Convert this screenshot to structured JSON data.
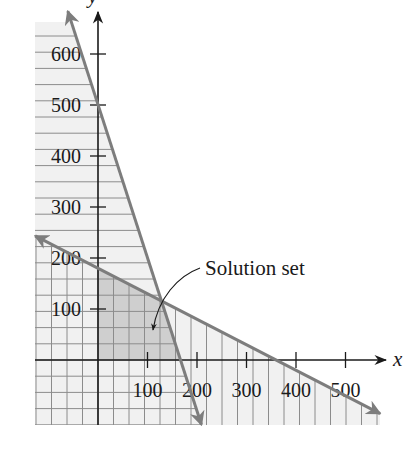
{
  "chart_data": {
    "type": "line",
    "title": "",
    "xlabel": "x",
    "ylabel": "y",
    "xlim": [
      -127,
      570
    ],
    "ylim": [
      -127,
      660
    ],
    "x_ticks": [
      100,
      200,
      300,
      400,
      500
    ],
    "y_ticks": [
      100,
      200,
      300,
      400,
      500,
      600
    ],
    "x_tick_labels": [
      "100",
      "200",
      "300",
      "400",
      "500"
    ],
    "y_tick_labels": [
      "100",
      "200",
      "300",
      "400",
      "500",
      "600"
    ],
    "grid": true,
    "series": [
      {
        "name": "3x + y = 500",
        "x_intercept": 166.7,
        "y_intercept": 500,
        "points": [
          [
            -61,
            684
          ],
          [
            209,
            -127
          ]
        ],
        "shaded_side": "below-left",
        "hatch": "horizontal"
      },
      {
        "name": "x + 2y = 360",
        "x_intercept": 360,
        "y_intercept": 180,
        "points": [
          [
            -127,
            243.5
          ],
          [
            570,
            -105
          ]
        ],
        "shaded_side": "below-left",
        "hatch": "vertical"
      }
    ],
    "intersection": [
      128,
      116
    ],
    "solution_set_vertices": [
      [
        0,
        0
      ],
      [
        0,
        180
      ],
      [
        128,
        116
      ],
      [
        166.7,
        0
      ]
    ],
    "annotations": [
      {
        "text": "Solution set",
        "points_to": [
          110,
          60
        ]
      }
    ]
  },
  "colors": {
    "boundary_line": "#7d7d7d",
    "axis": "#1a1a1a",
    "grid_line": "#8c8c8c",
    "hatch_background": "#f1f1f1",
    "solution_fill": "#cfcfcf"
  },
  "labels": {
    "x_axis": "x",
    "y_axis": "y",
    "annotation": "Solution set"
  }
}
